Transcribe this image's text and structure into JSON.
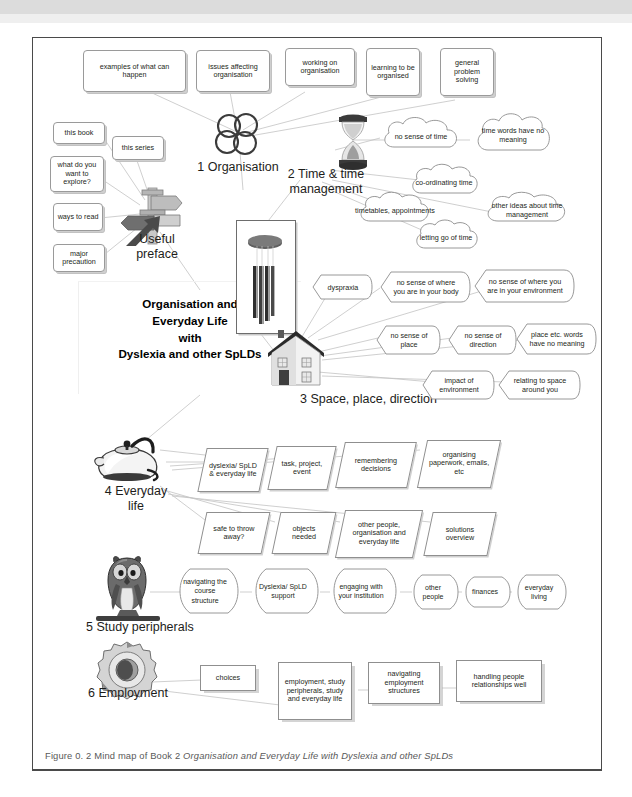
{
  "figure": {
    "caption_prefix": "Figure 0. 2  Mind map of Book 2 ",
    "caption_italic": "Organisation and Everyday Life with Dyslexia and other SpLDs"
  },
  "center": {
    "title_lines": [
      "Organisation and",
      "Everyday Life",
      "with",
      "Dyslexia and other SpLDs"
    ],
    "title_text": "Organisation and Everyday Life with Dyslexia and other SpLDs"
  },
  "branches": [
    {
      "id": "organisation",
      "label": "1 Organisation",
      "icon": "overlapping-circles-icon"
    },
    {
      "id": "time",
      "label": "2 Time & time management",
      "label_lines": [
        "2 Time & time",
        "management"
      ],
      "icon": "hourglass-icon"
    },
    {
      "id": "space",
      "label": "3 Space, place, direction",
      "icon": "house-icon"
    },
    {
      "id": "everyday",
      "label": "4 Everyday life",
      "label_lines": [
        "4 Everyday",
        "life"
      ],
      "icon": "kettle-icon"
    },
    {
      "id": "study",
      "label": "5 Study peripherals",
      "icon": "owl-icon"
    },
    {
      "id": "employment",
      "label": "6 Employment",
      "icon": "gear-icon"
    },
    {
      "id": "preface",
      "label": "Useful preface",
      "label_lines": [
        "Useful",
        "preface"
      ],
      "icon": "signpost-icon"
    }
  ],
  "organisation_nodes": [
    {
      "text": "examples of what can happen"
    },
    {
      "text": "issues affecting organisation"
    },
    {
      "text": "working on organisation"
    },
    {
      "text": "learning to be organised"
    },
    {
      "text": "general problem solving"
    }
  ],
  "preface_nodes": [
    {
      "text": "this book"
    },
    {
      "text": "this series"
    },
    {
      "text": "what do you want to explore?"
    },
    {
      "text": "ways to read"
    },
    {
      "text": "major precaution"
    }
  ],
  "time_nodes": [
    {
      "text": "no sense of time"
    },
    {
      "text": "time words have no meaning"
    },
    {
      "text": "co-ordinating time"
    },
    {
      "text": "timetables, appointments"
    },
    {
      "text": "other ideas about time management"
    },
    {
      "text": "letting go of time"
    }
  ],
  "space_nodes": [
    {
      "text": "dyspraxia"
    },
    {
      "text": "no sense of where you are in your body"
    },
    {
      "text": "no sense of where you are in your environment"
    },
    {
      "text": "no sense of place"
    },
    {
      "text": "no sense of direction"
    },
    {
      "text": "place etc. words have no meaning"
    },
    {
      "text": "impact of environment"
    },
    {
      "text": "relating to space around you"
    }
  ],
  "everyday_nodes": [
    {
      "text": "dyslexia/ SpLD & everyday life"
    },
    {
      "text": "task, project, event"
    },
    {
      "text": "remembering decisions"
    },
    {
      "text": "organising paperwork, emails, etc"
    },
    {
      "text": "safe to throw away?"
    },
    {
      "text": "objects needed"
    },
    {
      "text": "other people, organisation and everyday life"
    },
    {
      "text": "solutions overview"
    }
  ],
  "study_nodes": [
    {
      "text": "navigating the course structure"
    },
    {
      "text": "Dyslexia/ SpLD support"
    },
    {
      "text": "engaging with your institution"
    },
    {
      "text": "other people"
    },
    {
      "text": "finances"
    },
    {
      "text": "everyday living"
    }
  ],
  "employment_nodes": [
    {
      "text": "choices"
    },
    {
      "text": "employment, study peripherals, study and everyday life"
    },
    {
      "text": "navigating employment structures"
    },
    {
      "text": "handling people relationships well"
    }
  ],
  "colors": {
    "frame": "#4a4a4a",
    "node_border": "#9a9a9a",
    "text": "#231f20",
    "caption": "#595959",
    "page_bg": "#ffffff"
  }
}
